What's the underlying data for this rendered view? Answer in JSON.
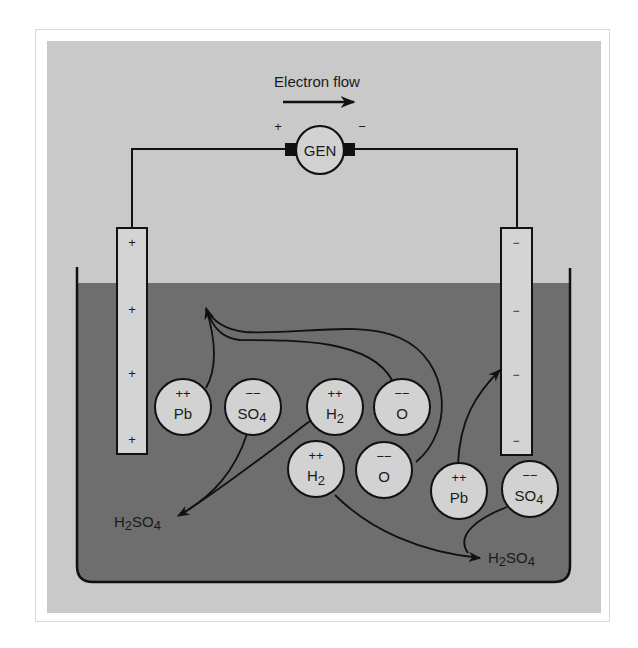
{
  "figure": {
    "title": "Electron flow",
    "generator": {
      "label": "GEN",
      "positive_sign": "+",
      "negative_sign": "−"
    },
    "colors": {
      "background_panel": "#c9c9c9",
      "electrolyte": "#6e6e6e",
      "ion_fill": "#d2d2d2",
      "electrode_fill": "#d4d4d4",
      "stroke": "#111111"
    },
    "electrodes": {
      "positive": {
        "name": "anode",
        "signs": [
          "+",
          "+",
          "+",
          "+"
        ]
      },
      "negative": {
        "name": "cathode",
        "signs": [
          "−",
          "−",
          "−",
          "−"
        ]
      }
    },
    "ions": [
      {
        "id": "pb-left",
        "charge": "++",
        "formula": "Pb",
        "sub": ""
      },
      {
        "id": "so4-left",
        "charge": "−−",
        "formula": "SO",
        "sub": "4"
      },
      {
        "id": "h2-upper",
        "charge": "++",
        "formula": "H",
        "sub": "2"
      },
      {
        "id": "o-upper",
        "charge": "−−",
        "formula": "O",
        "sub": ""
      },
      {
        "id": "h2-lower",
        "charge": "++",
        "formula": "H",
        "sub": "2"
      },
      {
        "id": "o-lower",
        "charge": "−−",
        "formula": "O",
        "sub": ""
      },
      {
        "id": "pb-right",
        "charge": "++",
        "formula": "Pb",
        "sub": ""
      },
      {
        "id": "so4-right",
        "charge": "−−",
        "formula": "SO",
        "sub": "4"
      }
    ],
    "products": [
      {
        "id": "h2so4-left",
        "p1": "H",
        "s1": "2",
        "p2": "SO",
        "s2": "4"
      },
      {
        "id": "h2so4-right",
        "p1": "H",
        "s1": "2",
        "p2": "SO",
        "s2": "4"
      }
    ]
  }
}
